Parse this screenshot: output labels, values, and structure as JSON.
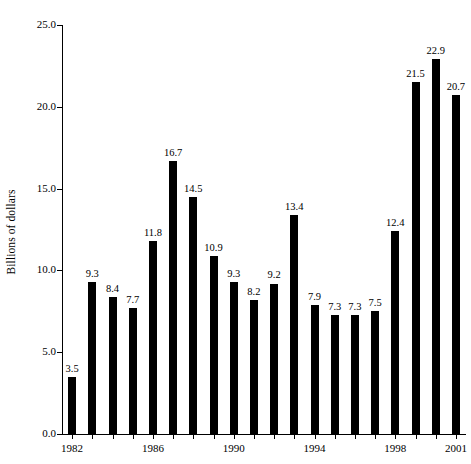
{
  "chart_data": {
    "type": "bar",
    "title": "",
    "subtitle": "",
    "xlabel": "",
    "ylabel": "Billions of dollars",
    "categories": [
      "1982",
      "1983",
      "1984",
      "1985",
      "1986",
      "1987",
      "1988",
      "1989",
      "1990",
      "1991",
      "1992",
      "1993",
      "1994",
      "1995",
      "1996",
      "1997",
      "1998",
      "1999",
      "2000",
      "2001"
    ],
    "values": [
      3.5,
      9.3,
      8.4,
      7.7,
      11.8,
      16.7,
      14.5,
      10.9,
      9.3,
      8.2,
      9.2,
      13.4,
      7.9,
      7.3,
      7.3,
      7.5,
      12.4,
      21.5,
      22.9,
      20.7
    ],
    "value_labels": [
      "3.5",
      "9.3",
      "8.4",
      "7.7",
      "11.8",
      "16.7",
      "14.5",
      "10.9",
      "9.3",
      "8.2",
      "9.2",
      "13.4",
      "7.9",
      "7.3",
      "7.3",
      "7.5",
      "12.4",
      "21.5",
      "22.9",
      "20.7"
    ],
    "ylim": [
      0,
      25
    ],
    "y_ticks": [
      0,
      5,
      10,
      15,
      20,
      25
    ],
    "y_tick_labels": [
      "0.0",
      "5.0",
      "10.0",
      "15.0",
      "20.0",
      "25.0"
    ],
    "x_tick_labels": [
      "1982",
      "1986",
      "1990",
      "1994",
      "1998",
      "2001"
    ],
    "x_tick_categories": [
      "1982",
      "1986",
      "1990",
      "1994",
      "1998",
      "2001"
    ],
    "grid": false,
    "legend": false,
    "legend_position": "none",
    "bar_color": "#000000",
    "axis_color": "#000000",
    "background_color": "#ffffff",
    "data_labels_shown": true
  }
}
